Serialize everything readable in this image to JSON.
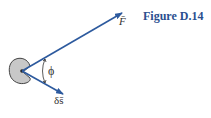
{
  "figure": {
    "caption": "Figure D.14",
    "labels": {
      "force": "F̄",
      "displacement": "δs̄",
      "angle": "ϕ"
    },
    "colors": {
      "arrow": "#2d5a9e",
      "caption": "#2a4f8f",
      "body_fill": "#c8c8c8",
      "body_stroke": "#444444"
    }
  }
}
